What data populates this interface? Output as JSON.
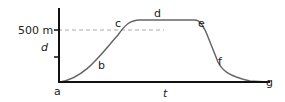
{
  "diagram": {
    "type": "distance-time graph",
    "y_axis": {
      "label": "d",
      "tick_label": "500 m"
    },
    "x_axis": {
      "label": "t"
    },
    "points": [
      "a",
      "b",
      "c",
      "d",
      "e",
      "f",
      "g"
    ],
    "colors": {
      "axis": "#111111",
      "curve": "#666666",
      "dashed": "#aaaaaa",
      "text": "#222222"
    }
  }
}
